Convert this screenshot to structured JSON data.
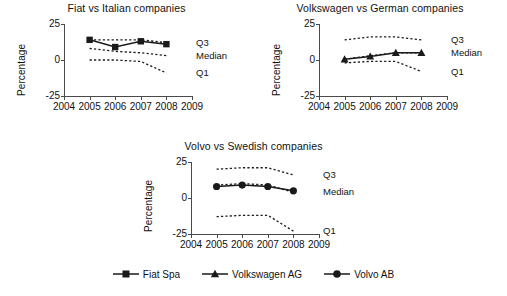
{
  "figure": {
    "panels": [
      "fiat",
      "vw",
      "volvo"
    ]
  },
  "legend": {
    "items": [
      {
        "label": "Fiat Spa",
        "marker": "square-marker-icon"
      },
      {
        "label": "Volkswagen AG",
        "marker": "triangle-marker-icon"
      },
      {
        "label": "Volvo AB",
        "marker": "circle-marker-icon"
      }
    ]
  },
  "axis": {
    "ylabel": "Percentage",
    "yticks": [
      "25",
      "0",
      "-25"
    ],
    "ytick_values": [
      25,
      0,
      -25
    ],
    "xticks": [
      "2004",
      "2005",
      "2006",
      "2007",
      "2008",
      "2009"
    ],
    "xtick_values": [
      2004,
      2005,
      2006,
      2007,
      2008,
      2009
    ],
    "series_labels": {
      "q3": "Q3",
      "median": "Median",
      "q1": "Q1"
    }
  },
  "chart_data": [
    {
      "type": "line",
      "id": "fiat",
      "title": "Fiat vs Italian companies",
      "xlabel": "",
      "ylabel": "Percentage",
      "x": [
        2005,
        2006,
        2007,
        2008
      ],
      "xlim": [
        2004,
        2009
      ],
      "ylim": [
        -25,
        25
      ],
      "grid": false,
      "legend_position": "right-inline",
      "annotations": [
        "Q3",
        "Median",
        "Q1"
      ],
      "series": [
        {
          "name": "Fiat Spa",
          "style": "solid",
          "marker": "square",
          "values": [
            14,
            9,
            13,
            11
          ]
        },
        {
          "name": "Q3",
          "style": "dotted",
          "marker": "none",
          "values": [
            14,
            14,
            14,
            12
          ]
        },
        {
          "name": "Median",
          "style": "dotted",
          "marker": "none",
          "values": [
            8,
            6,
            5,
            3
          ]
        },
        {
          "name": "Q1",
          "style": "dotted",
          "marker": "none",
          "values": [
            0,
            0,
            -1,
            -9
          ]
        }
      ]
    },
    {
      "type": "line",
      "id": "vw",
      "title": "Volkswagen vs German companies",
      "xlabel": "",
      "ylabel": "Percentage",
      "x": [
        2005,
        2006,
        2007,
        2008
      ],
      "xlim": [
        2004,
        2009
      ],
      "ylim": [
        -25,
        25
      ],
      "grid": false,
      "legend_position": "right-inline",
      "annotations": [
        "Q3",
        "Median",
        "Q1"
      ],
      "series": [
        {
          "name": "Volkswagen AG",
          "style": "solid",
          "marker": "triangle",
          "values": [
            0.5,
            2.5,
            5,
            5
          ]
        },
        {
          "name": "Q3",
          "style": "dotted",
          "marker": "none",
          "values": [
            14,
            16,
            16,
            14
          ]
        },
        {
          "name": "Median",
          "style": "dotted",
          "marker": "none",
          "values": [
            0.5,
            3,
            5,
            5
          ]
        },
        {
          "name": "Q1",
          "style": "dotted",
          "marker": "none",
          "values": [
            -2,
            -1,
            -1,
            -8
          ]
        }
      ]
    },
    {
      "type": "line",
      "id": "volvo",
      "title": "Volvo vs Swedish companies",
      "xlabel": "",
      "ylabel": "Percentage",
      "x": [
        2005,
        2006,
        2007,
        2008
      ],
      "xlim": [
        2004,
        2009
      ],
      "ylim": [
        -25,
        25
      ],
      "grid": false,
      "legend_position": "right-inline",
      "annotations": [
        "Q3",
        "Median",
        "Q1"
      ],
      "series": [
        {
          "name": "Volvo AB",
          "style": "solid",
          "marker": "circle",
          "values": [
            8,
            9,
            8,
            5
          ]
        },
        {
          "name": "Q3",
          "style": "dotted",
          "marker": "none",
          "values": [
            20,
            21,
            21,
            16
          ]
        },
        {
          "name": "Median",
          "style": "dotted",
          "marker": "none",
          "values": [
            9,
            10,
            9,
            4
          ]
        },
        {
          "name": "Q1",
          "style": "dotted",
          "marker": "none",
          "values": [
            -13,
            -12,
            -12,
            -23
          ]
        }
      ]
    }
  ]
}
